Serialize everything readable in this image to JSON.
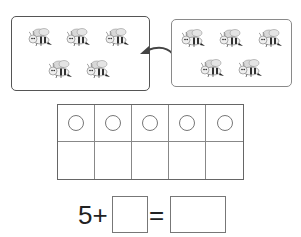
{
  "worksheet": {
    "left_group": {
      "bee_count": 5,
      "icon": "bee-icon"
    },
    "right_group": {
      "bee_count": 5,
      "icon": "bee-icon"
    },
    "arrow": {
      "icon": "curved-arrow-left-icon"
    },
    "ten_frame": {
      "columns": 5,
      "rows": 2,
      "top_row_counters": 5,
      "counter_icon": "circle-icon"
    },
    "equation": {
      "addend_1": "5",
      "plus": "+",
      "equals": "=",
      "addend_2_value": "",
      "sum_value": ""
    }
  },
  "colors": {
    "left_border": "#555555",
    "right_border": "#8a8a8a",
    "grid_line": "#888888",
    "text": "#222222"
  }
}
